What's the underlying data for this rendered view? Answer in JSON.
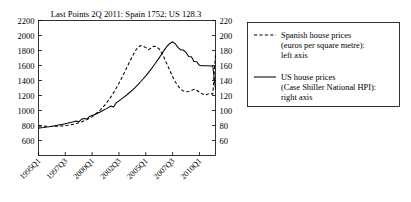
{
  "chart_data": {
    "type": "line",
    "title": "Last Points 2Q 2011: Spain 1752; US 128.3",
    "xlabel": "",
    "grid": false,
    "legend_position": "right",
    "x_tick_labels": [
      "1995Q1",
      "1997Q3",
      "2000Q1",
      "2002Q3",
      "2005Q1",
      "2007Q3",
      "2010Q1"
    ],
    "x_tick_indices": [
      0,
      10,
      20,
      30,
      40,
      50,
      60
    ],
    "left_axis": {
      "label": "",
      "ylim": [
        400,
        2200
      ],
      "ticks": [
        600,
        800,
        1000,
        1200,
        1400,
        1600,
        1800,
        2000,
        2200
      ]
    },
    "right_axis": {
      "label": "",
      "ylim": [
        40,
        220
      ],
      "ticks": [
        60,
        80,
        100,
        120,
        140,
        160,
        180,
        200,
        220
      ]
    },
    "x_start": "1995Q1",
    "x_end": "2011Q2",
    "series": [
      {
        "name": "Spanish house prices (euros per square metre): left axis",
        "short_name": "Spain",
        "axis": "left",
        "style": "dashed",
        "color": "#000000",
        "last_point": 1752,
        "values": [
          795,
          793,
          790,
          789,
          788,
          788,
          789,
          790,
          792,
          795,
          799,
          804,
          810,
          817,
          826,
          836,
          848,
          862,
          878,
          897,
          919,
          944,
          973,
          1006,
          1043,
          1085,
          1131,
          1182,
          1238,
          1299,
          1364,
          1433,
          1505,
          1578,
          1651,
          1722,
          1789,
          1840,
          1866,
          1858,
          1838,
          1812,
          1832,
          1856,
          1851,
          1820,
          1764,
          1692,
          1612,
          1530,
          1452,
          1383,
          1327,
          1286,
          1261,
          1251,
          1254,
          1266,
          1282,
          1270,
          1245,
          1222,
          1208,
          1215,
          1232,
          1218,
          1752
        ]
      },
      {
        "name": "US house prices (Case Shiller National HPI): right axis",
        "short_name": "US",
        "axis": "right",
        "style": "solid",
        "color": "#000000",
        "last_point": 128.3,
        "values": [
          76.5,
          77.0,
          77.4,
          77.9,
          78.4,
          79.0,
          79.6,
          80.2,
          80.9,
          81.6,
          82.4,
          83.2,
          84.1,
          85.0,
          86.0,
          84.9,
          88.2,
          89.4,
          88.6,
          91.9,
          93.3,
          94.8,
          96.4,
          98.1,
          99.9,
          101.8,
          103.8,
          105.9,
          104.6,
          110.4,
          112.9,
          115.5,
          118.2,
          121.0,
          124.0,
          127.2,
          130.6,
          134.2,
          138.0,
          142.0,
          146.2,
          150.6,
          155.2,
          160.0,
          165.0,
          170.2,
          175.6,
          181.2,
          186.0,
          189.4,
          191.6,
          189.0,
          184.2,
          180.8,
          180.6,
          177.4,
          172.0,
          171.8,
          165.2,
          165.0,
          160.2,
          159.8,
          159.6,
          159.6,
          159.4,
          159.4,
          128.3
        ]
      }
    ]
  },
  "legend": {
    "entries": [
      {
        "sample": "dashed-line-sample",
        "lines": [
          "Spanish house prices",
          "(euros per square metre):",
          "left axis"
        ]
      },
      {
        "sample": "solid-line-sample",
        "lines": [
          "US house prices",
          "(Case Shiller National HPI):",
          "right axis"
        ]
      }
    ]
  }
}
